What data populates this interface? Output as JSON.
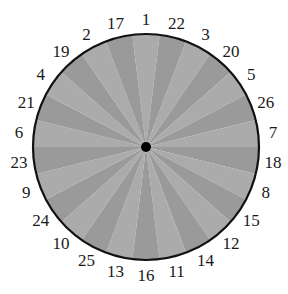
{
  "diagram": {
    "type": "circular-wheel",
    "center": {
      "x": 146,
      "y": 147
    },
    "radius": 113,
    "label_radius": 128,
    "wedge_count": 26,
    "colors": {
      "wedge_light": "#ababab",
      "wedge_dark": "#9a9a9a",
      "outline": "#111111",
      "hub": "#000000"
    },
    "labels_clockwise_from_top": [
      "1",
      "22",
      "3",
      "20",
      "5",
      "26",
      "7",
      "18",
      "8",
      "15",
      "12",
      "14",
      "11",
      "16",
      "13",
      "25",
      "10",
      "24",
      "9",
      "23",
      "6",
      "21",
      "4",
      "19",
      "2",
      "17"
    ]
  }
}
